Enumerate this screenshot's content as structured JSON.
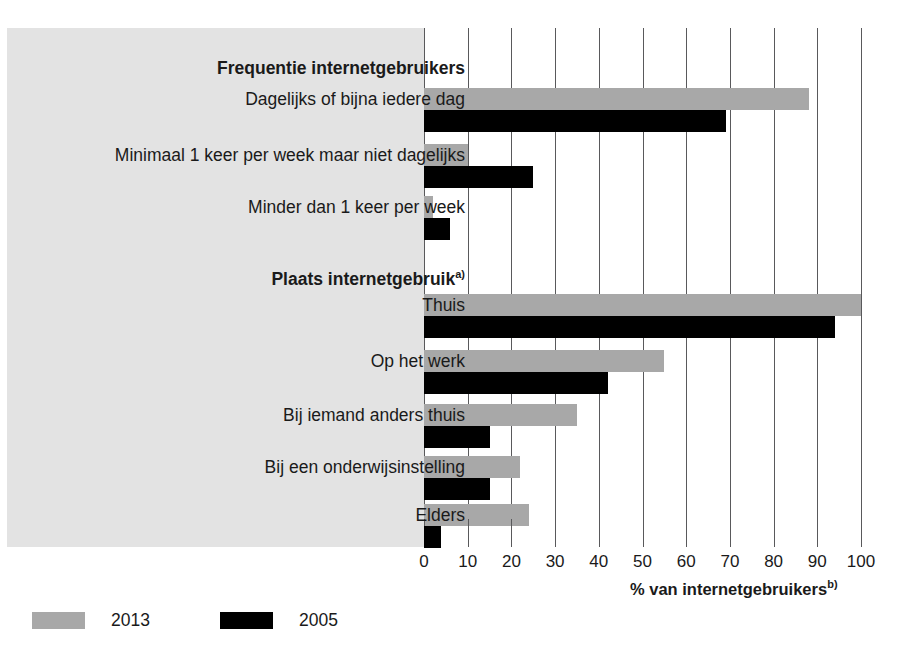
{
  "chart_data": {
    "type": "bar",
    "orientation": "horizontal",
    "title": "",
    "subtitle": "",
    "xlabel": "% van internetgebruikers",
    "xlabel_superscript": "b)",
    "ylabel": "",
    "xlim": [
      0,
      100
    ],
    "xticks": [
      0,
      10,
      20,
      30,
      40,
      50,
      60,
      70,
      80,
      90,
      100
    ],
    "xtick_labels": [
      "0",
      "10",
      "20",
      "30",
      "40",
      "50",
      "60",
      "70",
      "80",
      "90",
      "100"
    ],
    "grid": true,
    "grid_axis": "x",
    "legend_position": "bottom-left",
    "groups": [
      {
        "heading": "Frequentie internetgebruikers",
        "heading_superscript": "",
        "categories": [
          "Dagelijks of bijna iedere dag",
          "Minimaal 1 keer per week maar niet dagelijks",
          "Minder dan 1 keer per week"
        ]
      },
      {
        "heading": "Plaats internetgebruik",
        "heading_superscript": "a)",
        "categories": [
          "Thuis",
          "Op het werk",
          "Bij iemand anders thuis",
          "Bij een onderwijsinstelling",
          "Elders"
        ]
      }
    ],
    "categories": [
      "Dagelijks of bijna iedere dag",
      "Minimaal 1 keer per week maar niet dagelijks",
      "Minder dan 1 keer per week",
      "Thuis",
      "Op het werk",
      "Bij iemand anders thuis",
      "Bij een onderwijsinstelling",
      "Elders"
    ],
    "series": [
      {
        "name": "2013",
        "color": "#a8a8a8",
        "values": [
          88,
          10,
          2,
          100,
          55,
          35,
          22,
          24
        ]
      },
      {
        "name": "2005",
        "color": "#000000",
        "values": [
          69,
          25,
          6,
          94,
          42,
          15,
          15,
          4
        ]
      }
    ]
  },
  "legend": {
    "entries": [
      {
        "label": "2013",
        "color": "#a8a8a8"
      },
      {
        "label": "2005",
        "color": "#000000"
      }
    ]
  },
  "colors": {
    "panel_background": "#e3e3e3",
    "gridline": "#59595b",
    "text": "#1a1a1a",
    "series_2013": "#a8a8a8",
    "series_2005": "#000000"
  }
}
